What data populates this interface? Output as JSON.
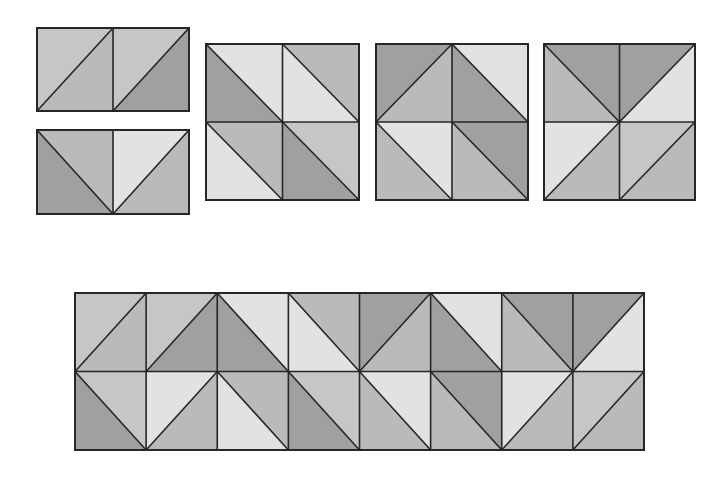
{
  "palette": {
    "dark": "#a0a0a0",
    "medium": "#bababa",
    "medlight": "#c6c6c6",
    "light": "#e2e2e2",
    "line": "#262626",
    "background": "#ffffff"
  },
  "legend_note": "Each cell is a square split along one diagonal. '/' runs bottom-left to top-right (halves: a=upper-left, b=lower-right). '\\' runs top-left to bottom-right (halves: a=upper-right, b=lower-left).",
  "blocks": [
    {
      "name": "two-patch-unit-a",
      "x": 37,
      "y": 28,
      "w": 152,
      "h": 83,
      "rows": 1,
      "cols": 2,
      "cells": [
        {
          "diag": "/",
          "a": "medlight",
          "b": "medium"
        },
        {
          "diag": "/",
          "a": "medlight",
          "b": "dark"
        }
      ]
    },
    {
      "name": "two-patch-unit-b",
      "x": 37,
      "y": 130,
      "w": 152,
      "h": 84,
      "rows": 1,
      "cols": 2,
      "cells": [
        {
          "diag": "\\",
          "a": "medium",
          "b": "dark"
        },
        {
          "diag": "/",
          "a": "light",
          "b": "medium"
        }
      ]
    },
    {
      "name": "four-patch-block-1",
      "x": 206,
      "y": 44,
      "w": 153,
      "h": 156,
      "rows": 2,
      "cols": 2,
      "cells": [
        {
          "diag": "\\",
          "a": "light",
          "b": "dark"
        },
        {
          "diag": "\\",
          "a": "medium",
          "b": "light"
        },
        {
          "diag": "\\",
          "a": "medium",
          "b": "light"
        },
        {
          "diag": "\\",
          "a": "medlight",
          "b": "dark"
        }
      ]
    },
    {
      "name": "four-patch-block-2",
      "x": 376,
      "y": 44,
      "w": 152,
      "h": 156,
      "rows": 2,
      "cols": 2,
      "cells": [
        {
          "diag": "/",
          "a": "dark",
          "b": "medium"
        },
        {
          "diag": "\\",
          "a": "light",
          "b": "dark"
        },
        {
          "diag": "\\",
          "a": "light",
          "b": "medium"
        },
        {
          "diag": "\\",
          "a": "dark",
          "b": "medium"
        }
      ]
    },
    {
      "name": "four-patch-block-3",
      "x": 544,
      "y": 44,
      "w": 151,
      "h": 156,
      "rows": 2,
      "cols": 2,
      "cells": [
        {
          "diag": "\\",
          "a": "dark",
          "b": "medium"
        },
        {
          "diag": "/",
          "a": "dark",
          "b": "light"
        },
        {
          "diag": "/",
          "a": "light",
          "b": "medium"
        },
        {
          "diag": "/",
          "a": "medlight",
          "b": "medium"
        }
      ]
    },
    {
      "name": "combined-strip",
      "x": 75,
      "y": 293,
      "w": 569,
      "h": 157,
      "rows": 2,
      "cols": 8,
      "cells": [
        {
          "diag": "/",
          "a": "medlight",
          "b": "medium"
        },
        {
          "diag": "/",
          "a": "medlight",
          "b": "dark"
        },
        {
          "diag": "\\",
          "a": "light",
          "b": "dark"
        },
        {
          "diag": "\\",
          "a": "medium",
          "b": "light"
        },
        {
          "diag": "/",
          "a": "dark",
          "b": "medium"
        },
        {
          "diag": "\\",
          "a": "light",
          "b": "dark"
        },
        {
          "diag": "\\",
          "a": "dark",
          "b": "medium"
        },
        {
          "diag": "/",
          "a": "dark",
          "b": "light"
        },
        {
          "diag": "\\",
          "a": "medlight",
          "b": "dark"
        },
        {
          "diag": "/",
          "a": "light",
          "b": "medium"
        },
        {
          "diag": "\\",
          "a": "medium",
          "b": "light"
        },
        {
          "diag": "\\",
          "a": "medlight",
          "b": "dark"
        },
        {
          "diag": "\\",
          "a": "light",
          "b": "medium"
        },
        {
          "diag": "\\",
          "a": "dark",
          "b": "medium"
        },
        {
          "diag": "/",
          "a": "light",
          "b": "medium"
        },
        {
          "diag": "/",
          "a": "medlight",
          "b": "medium"
        }
      ]
    }
  ]
}
